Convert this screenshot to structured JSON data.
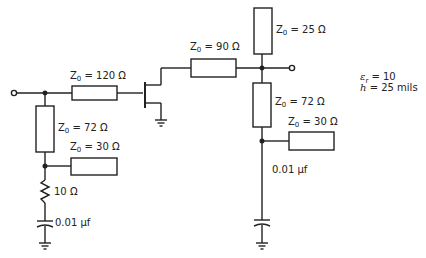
{
  "diagram": {
    "type": "microstrip FET amplifier matching network schematic",
    "substrate": {
      "er_label": "ε",
      "er_sub": "r",
      "er_value": "= 10",
      "h_label": "h",
      "h_value": "= 25 mils"
    },
    "lines": [
      {
        "id": "input-series",
        "z0_prefix": "Z",
        "z0_sub": "0",
        "value": "= 120 Ω"
      },
      {
        "id": "input-shunt",
        "z0_prefix": "Z",
        "z0_sub": "0",
        "value": "= 72 Ω"
      },
      {
        "id": "input-stub",
        "z0_prefix": "Z",
        "z0_sub": "0",
        "value": "= 30 Ω"
      },
      {
        "id": "output-series",
        "z0_prefix": "Z",
        "z0_sub": "0",
        "value": "= 90 Ω"
      },
      {
        "id": "output-stub-top",
        "z0_prefix": "Z",
        "z0_sub": "0",
        "value": "= 25 Ω"
      },
      {
        "id": "output-shunt",
        "z0_prefix": "Z",
        "z0_sub": "0",
        "value": "= 72 Ω"
      },
      {
        "id": "output-stub",
        "z0_prefix": "Z",
        "z0_sub": "0",
        "value": "= 30 Ω"
      }
    ],
    "components": {
      "input_resistor": "10 Ω",
      "input_capacitor": "0.01 μf",
      "output_capacitor": "0.01 μf"
    },
    "colors": {
      "ink": "#222222",
      "background": "#ffffff"
    }
  }
}
